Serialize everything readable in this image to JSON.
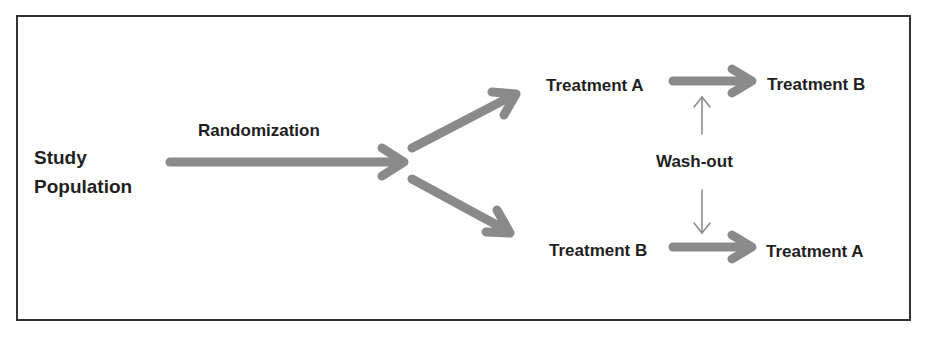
{
  "diagram": {
    "type": "crossover-study-design",
    "colors": {
      "frame": "#333333",
      "thick_arrow": "#8a8a8a",
      "thin_arrow": "#8c8c8c",
      "text": "#1f1f1f"
    },
    "nodes": {
      "study_population": {
        "line1": "Study",
        "line2": "Population"
      },
      "randomization": "Randomization",
      "arm1_period1": "Treatment A",
      "arm1_period2": "Treatment B",
      "arm2_period1": "Treatment B",
      "arm2_period2": "Treatment A",
      "washout": "Wash-out"
    },
    "edges": [
      {
        "from": "study_population",
        "to": "randomization-split",
        "label": "Randomization",
        "style": "thick"
      },
      {
        "from": "randomization-split",
        "to": "arm1_period1",
        "style": "thick"
      },
      {
        "from": "randomization-split",
        "to": "arm2_period1",
        "style": "thick"
      },
      {
        "from": "arm1_period1",
        "to": "arm1_period2",
        "style": "thick"
      },
      {
        "from": "arm2_period1",
        "to": "arm2_period2",
        "style": "thick"
      },
      {
        "from": "washout",
        "to": "arm1-transition",
        "style": "thin"
      },
      {
        "from": "washout",
        "to": "arm2-transition",
        "style": "thin"
      }
    ]
  }
}
